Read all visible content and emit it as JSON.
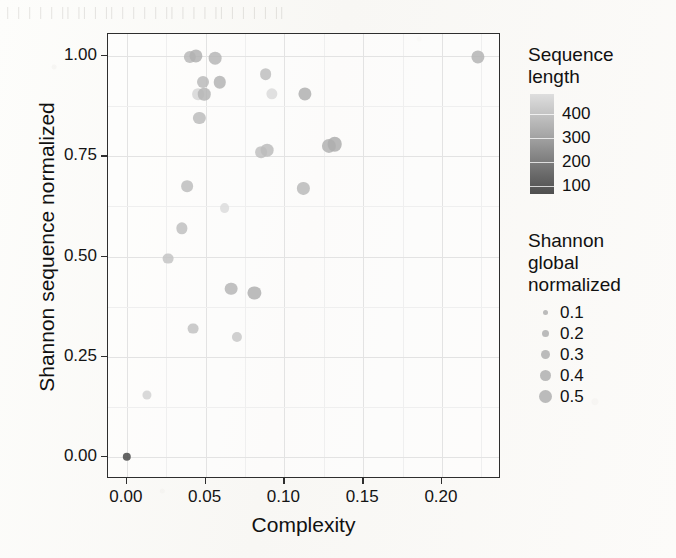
{
  "background": {
    "bleed_through_text": "| | |   |  |   ||  ||   |  ||  |  |   |  |  ||  |   |  |  ||   |   | |  |  ||"
  },
  "chart_data": {
    "type": "scatter",
    "title": "",
    "xlabel": "Complexity",
    "ylabel": "Shannon sequence normalized",
    "xlim": [
      -0.012,
      0.2375
    ],
    "ylim": [
      -0.055,
      1.055
    ],
    "xticks": [
      0.0,
      0.05,
      0.1,
      0.15,
      0.2
    ],
    "xticklabels": [
      "0.00",
      "0.05",
      "0.10",
      "0.15",
      "0.20"
    ],
    "yticks": [
      0.0,
      0.25,
      0.5,
      0.75,
      1.0
    ],
    "yticklabels": [
      "0.00",
      "0.25",
      "0.50",
      "0.75",
      "1.00"
    ],
    "grid": true,
    "grid_minor": true,
    "points": [
      {
        "x": 0.0,
        "y": 0.0,
        "size": 0.1,
        "color": "#4a4a4a"
      },
      {
        "x": 0.013,
        "y": 0.155,
        "size": 0.13,
        "color": "#d2d2d2"
      },
      {
        "x": 0.026,
        "y": 0.495,
        "size": 0.2,
        "color": "#c4c4c4"
      },
      {
        "x": 0.035,
        "y": 0.57,
        "size": 0.22,
        "color": "#c0c0c0"
      },
      {
        "x": 0.042,
        "y": 0.32,
        "size": 0.2,
        "color": "#c2c2c2"
      },
      {
        "x": 0.038,
        "y": 0.675,
        "size": 0.24,
        "color": "#bdbdbd"
      },
      {
        "x": 0.04,
        "y": 0.998,
        "size": 0.26,
        "color": "#b8b8b8"
      },
      {
        "x": 0.044,
        "y": 1.0,
        "size": 0.3,
        "color": "#b2b2b2"
      },
      {
        "x": 0.046,
        "y": 0.845,
        "size": 0.26,
        "color": "#bcbcbc"
      },
      {
        "x": 0.045,
        "y": 0.905,
        "size": 0.24,
        "color": "#d6d6d6"
      },
      {
        "x": 0.049,
        "y": 0.905,
        "size": 0.27,
        "color": "#b5b5b5"
      },
      {
        "x": 0.048,
        "y": 0.935,
        "size": 0.25,
        "color": "#bababa"
      },
      {
        "x": 0.056,
        "y": 0.995,
        "size": 0.28,
        "color": "#b6b6b6"
      },
      {
        "x": 0.059,
        "y": 0.935,
        "size": 0.27,
        "color": "#b4b4b4"
      },
      {
        "x": 0.062,
        "y": 0.62,
        "size": 0.16,
        "color": "#dcdcdc"
      },
      {
        "x": 0.066,
        "y": 0.42,
        "size": 0.28,
        "color": "#b6b6b6"
      },
      {
        "x": 0.07,
        "y": 0.3,
        "size": 0.17,
        "color": "#c8c8c8"
      },
      {
        "x": 0.085,
        "y": 0.76,
        "size": 0.24,
        "color": "#c0c0c0"
      },
      {
        "x": 0.081,
        "y": 0.41,
        "size": 0.3,
        "color": "#b0b0b0"
      },
      {
        "x": 0.089,
        "y": 0.765,
        "size": 0.28,
        "color": "#bcbcbc"
      },
      {
        "x": 0.088,
        "y": 0.955,
        "size": 0.24,
        "color": "#bebebe"
      },
      {
        "x": 0.092,
        "y": 0.905,
        "size": 0.22,
        "color": "#dadada"
      },
      {
        "x": 0.112,
        "y": 0.67,
        "size": 0.26,
        "color": "#bababa"
      },
      {
        "x": 0.113,
        "y": 0.905,
        "size": 0.3,
        "color": "#b0b0b0"
      },
      {
        "x": 0.128,
        "y": 0.775,
        "size": 0.34,
        "color": "#b2b2b2"
      },
      {
        "x": 0.132,
        "y": 0.78,
        "size": 0.36,
        "color": "#aeaeae"
      },
      {
        "x": 0.223,
        "y": 0.998,
        "size": 0.3,
        "color": "#b4b4b4"
      }
    ]
  },
  "legends": {
    "color_legend": {
      "title_line1": "Sequence",
      "title_line2": "length",
      "type": "colorbar",
      "ticks": [
        400,
        300,
        200,
        100
      ],
      "ticklabels": [
        "400",
        "300",
        "200",
        "100"
      ],
      "gradient_high_color": "#dedede",
      "gradient_low_color": "#4f4f4f"
    },
    "size_legend": {
      "title_line1": "Shannon",
      "title_line2": "global",
      "title_line3": "normalized",
      "items": [
        {
          "label": "0.1",
          "dot_px": 5
        },
        {
          "label": "0.2",
          "dot_px": 7
        },
        {
          "label": "0.3",
          "dot_px": 9
        },
        {
          "label": "0.4",
          "dot_px": 11
        },
        {
          "label": "0.5",
          "dot_px": 13
        }
      ],
      "dot_color": "#b4b4b4"
    }
  }
}
